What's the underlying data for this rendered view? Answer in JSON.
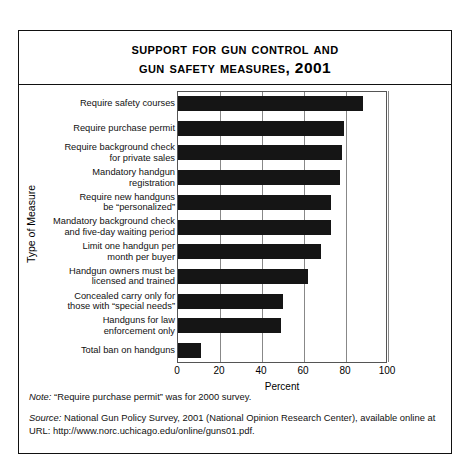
{
  "figure": {
    "title_line1": "Support for Gun Control and",
    "title_line2": "Gun Safety Measures, 2001"
  },
  "notes": {
    "note_label": "Note:",
    "note_text": "“Require purchase permit” was for 2000 survey.",
    "source_label": "Source:",
    "source_text": "National Gun Policy Survey, 2001 (National Opinion Research Center), available online at URL: http://www.norc.uchicago.edu/online/guns01.pdf."
  },
  "chart_data": {
    "type": "bar",
    "orientation": "horizontal",
    "title": "Support for Gun Control and Gun Safety Measures, 2001",
    "xlabel": "Percent",
    "ylabel": "Type of Measure",
    "xlim": [
      0,
      100
    ],
    "xticks": [
      0,
      20,
      40,
      60,
      80,
      100
    ],
    "grid": true,
    "legend": "none",
    "bar_color": "#151515",
    "categories": [
      "Require safety courses",
      "Require purchase permit",
      "Require background check for private sales",
      "Mandatory handgun registration",
      "Require new handguns be “personalized”",
      "Mandatory background check and five-day waiting period",
      "Limit one handgun per month per buyer",
      "Handgun owners must be licensed and trained",
      "Concealed carry only for those with “special needs”",
      "Handguns for law enforcement only",
      "Total ban on handguns"
    ],
    "category_lines": [
      [
        "Require safety courses"
      ],
      [
        "Require purchase permit"
      ],
      [
        "Require background check",
        "for private sales"
      ],
      [
        "Mandatory handgun",
        "registration"
      ],
      [
        "Require new handguns",
        "be “personalized”"
      ],
      [
        "Mandatory background check",
        "and five-day waiting period"
      ],
      [
        "Limit one handgun per",
        "month per buyer"
      ],
      [
        "Handgun owners must be",
        "licensed and trained"
      ],
      [
        "Concealed carry only for",
        "those with “special needs”"
      ],
      [
        "Handguns for law",
        "enforcement only"
      ],
      [
        "Total ban on handguns"
      ]
    ],
    "values": [
      88,
      79,
      78,
      77,
      73,
      73,
      68,
      62,
      50,
      49,
      11
    ]
  }
}
